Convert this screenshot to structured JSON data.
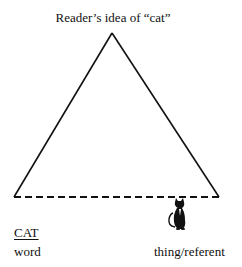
{
  "diagram": {
    "type": "semiotic-triangle",
    "apex": {
      "label": "Reader’s idea of “cat”"
    },
    "left_vertex": {
      "symbol": "CAT",
      "caption": "word"
    },
    "right_vertex": {
      "icon": "black-cat-icon",
      "caption": "thing/referent"
    },
    "edges": [
      {
        "from": "word",
        "to": "idea",
        "style": "solid"
      },
      {
        "from": "idea",
        "to": "referent",
        "style": "solid"
      },
      {
        "from": "word",
        "to": "referent",
        "style": "dashed"
      }
    ],
    "colors": {
      "line": "#111111",
      "background": "#ffffff"
    }
  }
}
